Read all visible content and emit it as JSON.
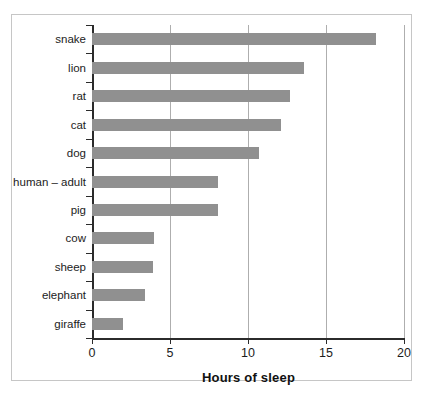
{
  "chart_data": {
    "type": "bar",
    "orientation": "horizontal",
    "title": "",
    "xlabel": "Hours of sleep",
    "ylabel": "",
    "xlim": [
      0,
      20
    ],
    "xticks": [
      0,
      5,
      10,
      15,
      20
    ],
    "xtick_labels": [
      "0",
      "5",
      "10",
      "15",
      "20"
    ],
    "grid": true,
    "grid_axis": "x",
    "legend": null,
    "bar_color": "#909090",
    "axis_color": "#2b2b2b",
    "gridline_color": "#aeaeae",
    "frame_color": "#c6c6c6",
    "background": "#ffffff",
    "categories": [
      "snake",
      "lion",
      "rat",
      "cat",
      "dog",
      "human – adult",
      "pig",
      "cow",
      "sheep",
      "elephant",
      "giraffe"
    ],
    "values": [
      18.2,
      13.6,
      12.7,
      12.1,
      10.7,
      8.1,
      8.1,
      4.0,
      3.9,
      3.4,
      2.0
    ]
  }
}
